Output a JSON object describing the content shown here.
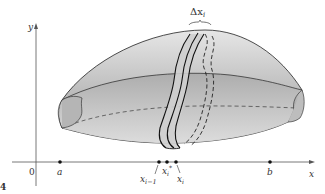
{
  "figure": {
    "type": "solid-of-revolution-slice",
    "axes": {
      "x_label": "x",
      "y_label": "y",
      "origin_label": "0"
    },
    "points": [
      {
        "id": "a",
        "label": "a"
      },
      {
        "id": "x_im1",
        "label": "x",
        "sub": "i−1"
      },
      {
        "id": "x_star",
        "label": "x",
        "sub": "i",
        "sup": "*"
      },
      {
        "id": "x_i",
        "label": "x",
        "sub": "i"
      },
      {
        "id": "b",
        "label": "b"
      }
    ],
    "slice_width_label": "Δx",
    "slice_width_sub": "i",
    "fig_marker": "4",
    "colors": {
      "solid_fill_light": "#c8c8c8",
      "solid_fill_dark": "#8a8a8a",
      "slice_fill": "#d9d9d9",
      "stroke": "#222222",
      "axis": "#555555"
    }
  }
}
